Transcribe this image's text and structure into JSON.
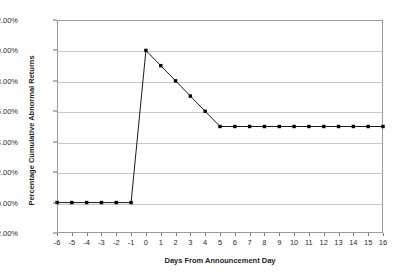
{
  "chart_data": {
    "type": "line",
    "title": "Panel B: Case 2",
    "xlabel": "Days From Announcement Day",
    "ylabel": "Percentage Cumulative Abnormal Returns",
    "x": [
      -6,
      -5,
      -4,
      -3,
      -2,
      -1,
      0,
      1,
      2,
      3,
      4,
      5,
      6,
      7,
      8,
      9,
      10,
      11,
      12,
      13,
      14,
      15,
      16
    ],
    "xticklabels": [
      "-6",
      "-5",
      "-4",
      "-3",
      "-2",
      "-1",
      "0",
      "1",
      "2",
      "3",
      "4",
      "5",
      "6",
      "7",
      "8",
      "9",
      "10",
      "11",
      "12",
      "13",
      "14",
      "15",
      "16"
    ],
    "values": [
      0.0,
      0.0,
      0.0,
      0.0,
      0.0,
      0.0,
      10.0,
      9.0,
      8.0,
      7.0,
      6.0,
      5.0,
      5.0,
      5.0,
      5.0,
      5.0,
      5.0,
      5.0,
      5.0,
      5.0,
      5.0,
      5.0,
      5.0
    ],
    "yticks": [
      -2.0,
      0.0,
      2.0,
      4.0,
      6.0,
      8.0,
      10.0,
      12.0
    ],
    "yticklabels": [
      "-2.00%",
      "0.00%",
      "2.00%",
      "4.00%",
      "6.00%",
      "8.00%",
      "10.00%",
      "12.00%"
    ],
    "ylim": [
      -2.0,
      12.0
    ],
    "xlim": [
      -6,
      16
    ],
    "grid": "horizontal",
    "legend": "none",
    "series_color": "#000000",
    "marker": "filled-square",
    "gridline_color": "#c9c9c9",
    "frame_color": "#9a9a9a",
    "background": "#ffffff"
  }
}
